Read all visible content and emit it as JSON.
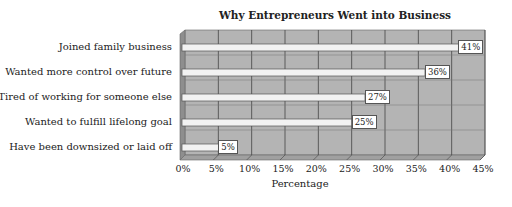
{
  "chart_data": {
    "type": "bar",
    "orientation": "horizontal",
    "title": "Why Entrepreneurs Went into Business",
    "xlabel": "Percentage",
    "ylabel": "",
    "categories": [
      "Joined family business",
      "Wanted more control over future",
      "Tired of working for someone else",
      "Wanted to fulfill lifelong goal",
      "Have been downsized or laid off"
    ],
    "values": [
      41,
      36,
      27,
      25,
      5
    ],
    "data_labels": [
      "41%",
      "36%",
      "27%",
      "25%",
      "5%"
    ],
    "xlim": [
      0,
      45
    ],
    "x_ticks": [
      "0%",
      "5%",
      "10%",
      "15%",
      "20%",
      "25%",
      "30%",
      "35%",
      "40%",
      "45%"
    ],
    "grid": true,
    "style": "3d",
    "legend": null
  },
  "colors": {
    "wall": "#b4b4b4",
    "bar": "#f2f2f2",
    "gridline": "#444444"
  }
}
